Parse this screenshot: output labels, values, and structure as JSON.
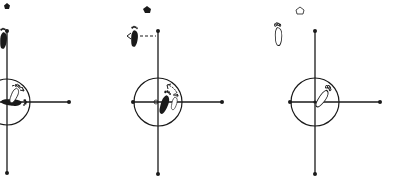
{
  "diagram": {
    "type": "dance-step-foot-position-diagram",
    "colors": {
      "ink": "#1a1a1a",
      "paper": "#ffffff"
    },
    "panels": [
      {
        "id": 1,
        "marker": "filled-pentagon",
        "active_foot": "filled (black)",
        "description": "Foot rotating inside circle, starting on the horizontal axis",
        "has_rotation_arrow": true,
        "has_side_arrow": false
      },
      {
        "id": 2,
        "marker": "filled-pentagon",
        "active_foot": "filled (black)",
        "description": "Foot moving sideways to the left along dashed line; turning foot in circle",
        "has_rotation_arrow": true,
        "has_side_arrow": true
      },
      {
        "id": 3,
        "marker": "outline-pentagon",
        "active_foot": "outline (white)",
        "description": "Outline foot at upper left; outline foot in circle",
        "has_rotation_arrow": false,
        "has_side_arrow": false
      }
    ]
  }
}
